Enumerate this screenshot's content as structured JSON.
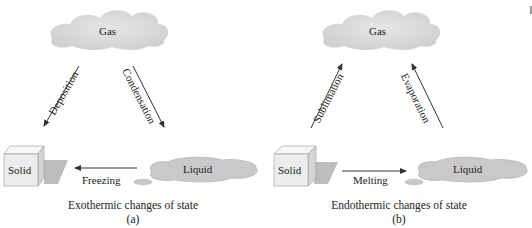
{
  "panels": [
    {
      "id": "a",
      "caption": "Exothermic changes of state",
      "sublabel": "(a)",
      "states": {
        "gas": "Gas",
        "solid": "Solid",
        "liquid": "Liquid"
      },
      "transitions": {
        "gas_solid": "Deposition",
        "gas_liquid": "Condensation",
        "solid_liquid": "Freezing"
      },
      "directions": {
        "gas_solid": "gas-to-solid",
        "gas_liquid": "gas-to-liquid",
        "solid_liquid": "liquid-to-solid"
      }
    },
    {
      "id": "b",
      "caption": "Endothermic changes of state",
      "sublabel": "(b)",
      "states": {
        "gas": "Gas",
        "solid": "Solid",
        "liquid": "Liquid"
      },
      "transitions": {
        "gas_solid": "Sublimation",
        "gas_liquid": "Evaporation",
        "solid_liquid": "Melting"
      },
      "directions": {
        "gas_solid": "solid-to-gas",
        "gas_liquid": "liquid-to-gas",
        "solid_liquid": "solid-to-liquid"
      }
    }
  ],
  "colors": {
    "cloud": "#d9d9d9",
    "cube_front": "#ececec",
    "cube_top": "#f6f6f6",
    "cube_side": "#d4d4d4",
    "shadow": "#bdbdbd",
    "liquid": "#c9c9c9",
    "arrow": "#333333"
  }
}
